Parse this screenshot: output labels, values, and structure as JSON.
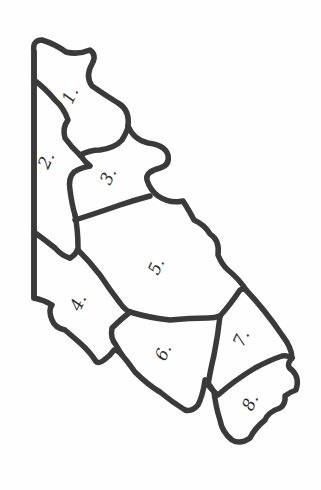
{
  "map": {
    "type": "outline-map",
    "style": "hand-drawn",
    "stroke_color": "#3a3a3a",
    "background_color": "#ffffff",
    "orientation_rotation_deg": 90,
    "regions": [
      {
        "id": 1,
        "label": "1."
      },
      {
        "id": 2,
        "label": "2."
      },
      {
        "id": 3,
        "label": "3."
      },
      {
        "id": 4,
        "label": "4."
      },
      {
        "id": 5,
        "label": "5."
      },
      {
        "id": 6,
        "label": "6."
      },
      {
        "id": 7,
        "label": "7."
      },
      {
        "id": 8,
        "label": "8."
      }
    ]
  }
}
